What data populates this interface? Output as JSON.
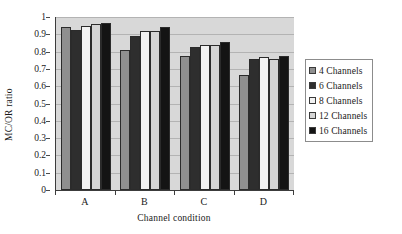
{
  "chart_data": {
    "type": "bar",
    "title": "",
    "xlabel": "Channel condition",
    "ylabel": "MC/OR ratio",
    "categories": [
      "A",
      "B",
      "C",
      "D"
    ],
    "ylim": [
      0,
      1
    ],
    "yticks": [
      0,
      0.1,
      0.2,
      0.3,
      0.4,
      0.5,
      0.6,
      0.7,
      0.8,
      0.9,
      1
    ],
    "ytick_labels": [
      "0",
      "0.1",
      "0.2",
      "0.3",
      "0.4",
      "0.5",
      "0.6",
      "0.7",
      "0.8",
      "0.9",
      "1"
    ],
    "grid": true,
    "legend_position": "right",
    "plot_background": "#d8d8d8",
    "series": [
      {
        "name": "4 Channels",
        "color": "#8f8f8f",
        "values": [
          0.94,
          0.81,
          0.775,
          0.665
        ]
      },
      {
        "name": "6 Channels",
        "color": "#2e2e2e",
        "values": [
          0.925,
          0.89,
          0.825,
          0.76
        ]
      },
      {
        "name": "8 Channels",
        "color": "#f2f2f2",
        "values": [
          0.95,
          0.92,
          0.84,
          0.77
        ]
      },
      {
        "name": "12 Channels",
        "color": "#d5d5d5",
        "values": [
          0.96,
          0.92,
          0.84,
          0.76
        ]
      },
      {
        "name": "16 Channels",
        "color": "#141414",
        "values": [
          0.965,
          0.945,
          0.855,
          0.775
        ]
      }
    ]
  }
}
